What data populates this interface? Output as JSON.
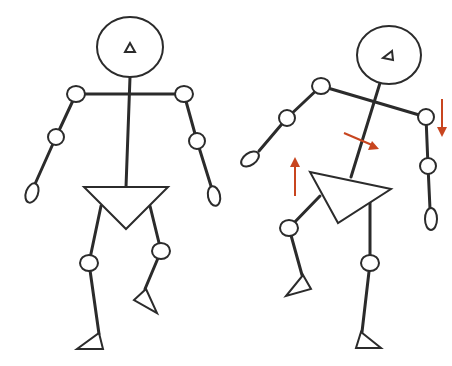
{
  "figure": {
    "description": "Two stick-figure mannequins: neutral standing pose and a weight-shifted pose with tilted shoulders and hips",
    "colors": {
      "line": "#2b2b2b",
      "joint_fill": "#ffffff",
      "arrow": "#c8451f",
      "background": "#ffffff"
    },
    "figures": [
      {
        "id": "neutral",
        "label": "Neutral pose"
      },
      {
        "id": "shifted",
        "label": "Weight-shifted pose",
        "arrows": [
          {
            "direction": "up",
            "location": "left hip"
          },
          {
            "direction": "down-right",
            "location": "torso"
          },
          {
            "direction": "down",
            "location": "right shoulder"
          }
        ]
      }
    ]
  }
}
